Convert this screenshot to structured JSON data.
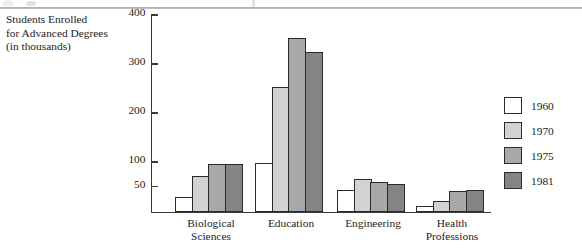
{
  "axis_caption": {
    "line1": "Students Enrolled",
    "line2": "for Advanced Degrees",
    "line3": "(in thousands)"
  },
  "legend": {
    "position": "right",
    "entries": [
      {
        "label": "1960",
        "color": "#ffffff"
      },
      {
        "label": "1970",
        "color": "#d2d2d2"
      },
      {
        "label": "1975",
        "color": "#a8a8a8"
      },
      {
        "label": "1981",
        "color": "#848484"
      }
    ]
  },
  "chart_data": {
    "type": "bar",
    "title": "",
    "subtitle": "",
    "xlabel": "",
    "ylabel": "Students Enrolled for Advanced Degrees (in thousands)",
    "ylim": [
      0,
      400
    ],
    "yticks": [
      50,
      100,
      200,
      300,
      400
    ],
    "ytick_labels": [
      "50",
      "100",
      "200",
      "300",
      "400"
    ],
    "grid": false,
    "legend_position": "right",
    "categories": [
      "Biological\nSciences",
      "Education",
      "Engineering",
      "Health\nProfessions"
    ],
    "category_lines": [
      [
        "Biological",
        "Sciences"
      ],
      [
        "Education"
      ],
      [
        "Engineering"
      ],
      [
        "Health",
        "Professions"
      ]
    ],
    "series": [
      {
        "name": "1960",
        "color": "#ffffff",
        "values": [
          30,
          100,
          45,
          12
        ]
      },
      {
        "name": "1970",
        "color": "#d2d2d2",
        "values": [
          72,
          255,
          67,
          22
        ]
      },
      {
        "name": "1975",
        "color": "#a8a8a8",
        "values": [
          97,
          355,
          60,
          42
        ]
      },
      {
        "name": "1981",
        "color": "#848484",
        "values": [
          97,
          325,
          57,
          45
        ]
      }
    ]
  }
}
